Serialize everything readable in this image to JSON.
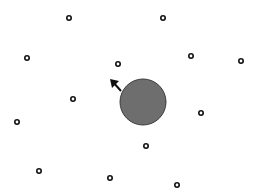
{
  "game": {
    "canvas": {
      "width": 257,
      "height": 196,
      "background": "#ffffff"
    },
    "player": {
      "cx": 143,
      "cy": 102,
      "r": 23,
      "fill": "#6e6e6e",
      "stroke": "#3a3a3a",
      "direction_arrow": {
        "x1": 121,
        "y1": 91,
        "x2": 110,
        "y2": 79,
        "color": "#111111"
      }
    },
    "pellets": [
      {
        "x": 69,
        "y": 18
      },
      {
        "x": 163,
        "y": 18
      },
      {
        "x": 27,
        "y": 58
      },
      {
        "x": 118,
        "y": 64
      },
      {
        "x": 191,
        "y": 56
      },
      {
        "x": 241,
        "y": 61
      },
      {
        "x": 73,
        "y": 99
      },
      {
        "x": 201,
        "y": 113
      },
      {
        "x": 17,
        "y": 122
      },
      {
        "x": 146,
        "y": 146
      },
      {
        "x": 39,
        "y": 171
      },
      {
        "x": 110,
        "y": 178
      },
      {
        "x": 177,
        "y": 185
      }
    ],
    "pellet_style": {
      "r": 2.2,
      "stroke": "#111111",
      "fill": "#ffffff",
      "stroke_width": 1.6
    }
  }
}
